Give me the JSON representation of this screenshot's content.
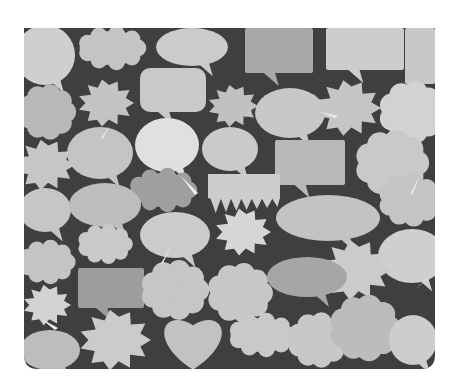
{
  "image": {
    "description": "Grayscale collage of assorted comic speech, thought and burst bubbles on a dark background",
    "width": 461,
    "height": 392,
    "frame": {
      "x": 24,
      "y": 28,
      "w": 411,
      "h": 341,
      "bottom_radius": 14
    },
    "colors": {
      "page_bg": "#ffffff",
      "dark_bg": "#3f3f3f",
      "bubble_light": "#d6d6d6",
      "bubble_mid": "#c2c2c2",
      "bubble_dark": "#a9a9a9",
      "bubble_darker": "#8f8f8f",
      "highlight": "#eeeeee"
    }
  },
  "bubbles": [
    {
      "type": "ellipse",
      "cx": 45,
      "cy": 55,
      "rx": 30,
      "ry": 30,
      "fill": "#cfcfcf"
    },
    {
      "type": "cloud",
      "cx": 112,
      "cy": 48,
      "rx": 36,
      "ry": 20,
      "fill": "#c4c4c4"
    },
    {
      "type": "ellipse",
      "cx": 192,
      "cy": 47,
      "rx": 36,
      "ry": 19,
      "fill": "#cbcbcb"
    },
    {
      "type": "rect",
      "x": 245,
      "y": 28,
      "w": 68,
      "h": 45,
      "fill": "#a9a9a9"
    },
    {
      "type": "rect",
      "x": 326,
      "y": 28,
      "w": 78,
      "h": 42,
      "fill": "#cdcdcd"
    },
    {
      "type": "rect",
      "x": 405,
      "y": 28,
      "w": 30,
      "h": 56,
      "fill": "#c8c8c8"
    },
    {
      "type": "cloud",
      "cx": 47,
      "cy": 112,
      "rx": 26,
      "ry": 25,
      "fill": "#b8b8b8"
    },
    {
      "type": "burst",
      "cx": 106,
      "cy": 103,
      "r": 28,
      "fill": "#c3c3c3"
    },
    {
      "type": "rect",
      "x": 140,
      "y": 68,
      "w": 66,
      "h": 44,
      "rx": 10,
      "fill": "#c9c9c9"
    },
    {
      "type": "burst",
      "cx": 233,
      "cy": 106,
      "r": 25,
      "fill": "#c1c1c1"
    },
    {
      "type": "ellipse",
      "cx": 290,
      "cy": 113,
      "rx": 35,
      "ry": 25,
      "fill": "#c8c8c8"
    },
    {
      "type": "burst",
      "cx": 348,
      "cy": 108,
      "r": 33,
      "fill": "#c5c5c5"
    },
    {
      "type": "cloud",
      "cx": 412,
      "cy": 112,
      "rx": 30,
      "ry": 28,
      "fill": "#d2d2d2"
    },
    {
      "type": "ellipse",
      "cx": 167,
      "cy": 145,
      "rx": 32,
      "ry": 27,
      "fill": "#e0e0e0"
    },
    {
      "type": "ellipse",
      "cx": 100,
      "cy": 153,
      "rx": 33,
      "ry": 26,
      "fill": "#c4c4c4"
    },
    {
      "type": "ellipse",
      "cx": 230,
      "cy": 149,
      "rx": 28,
      "ry": 22,
      "fill": "#cacaca"
    },
    {
      "type": "burst",
      "cx": 45,
      "cy": 165,
      "r": 30,
      "fill": "#c6c6c6"
    },
    {
      "type": "rect",
      "x": 275,
      "y": 140,
      "w": 70,
      "h": 45,
      "fill": "#b9b9b9"
    },
    {
      "type": "cloud",
      "cx": 392,
      "cy": 163,
      "rx": 34,
      "ry": 30,
      "fill": "#c9c9c9"
    },
    {
      "type": "cloud",
      "cx": 163,
      "cy": 190,
      "rx": 36,
      "ry": 20,
      "fill": "#9f9f9f"
    },
    {
      "type": "drip",
      "x": 208,
      "y": 174,
      "w": 72,
      "h": 40,
      "fill": "#cdcdcd"
    },
    {
      "type": "ellipse",
      "cx": 45,
      "cy": 210,
      "rx": 26,
      "ry": 22,
      "fill": "#c6c6c6"
    },
    {
      "type": "ellipse",
      "cx": 105,
      "cy": 205,
      "rx": 36,
      "ry": 22,
      "fill": "#bdbdbd"
    },
    {
      "type": "ellipse",
      "cx": 328,
      "cy": 218,
      "rx": 52,
      "ry": 23,
      "fill": "#c3c3c3"
    },
    {
      "type": "cloud",
      "cx": 410,
      "cy": 200,
      "rx": 30,
      "ry": 24,
      "fill": "#c4c4c4"
    },
    {
      "type": "burst",
      "cx": 243,
      "cy": 232,
      "r": 28,
      "fill": "#d6d6d6"
    },
    {
      "type": "ellipse",
      "cx": 175,
      "cy": 235,
      "rx": 35,
      "ry": 23,
      "fill": "#cbcbcb"
    },
    {
      "type": "cloud",
      "cx": 105,
      "cy": 244,
      "rx": 28,
      "ry": 18,
      "fill": "#c9c9c9"
    },
    {
      "type": "cloud",
      "cx": 47,
      "cy": 262,
      "rx": 28,
      "ry": 20,
      "fill": "#c4c4c4"
    },
    {
      "type": "ellipse",
      "cx": 412,
      "cy": 256,
      "rx": 34,
      "ry": 27,
      "fill": "#cfcfcf"
    },
    {
      "type": "burst",
      "cx": 355,
      "cy": 270,
      "r": 36,
      "fill": "#cbcbcb"
    },
    {
      "type": "ellipse",
      "cx": 307,
      "cy": 277,
      "rx": 40,
      "ry": 20,
      "fill": "#a6a6a6"
    },
    {
      "type": "rect",
      "x": 78,
      "y": 268,
      "w": 66,
      "h": 40,
      "fill": "#9d9d9d"
    },
    {
      "type": "cloud",
      "cx": 175,
      "cy": 290,
      "rx": 32,
      "ry": 27,
      "fill": "#c6c6c6"
    },
    {
      "type": "cloud",
      "cx": 240,
      "cy": 293,
      "rx": 30,
      "ry": 27,
      "fill": "#c7c7c7"
    },
    {
      "type": "burst",
      "cx": 47,
      "cy": 305,
      "r": 24,
      "fill": "#d2d2d2"
    },
    {
      "type": "burst",
      "cx": 115,
      "cy": 340,
      "r": 36,
      "fill": "#cbcbcb"
    },
    {
      "type": "heart",
      "cx": 193,
      "cy": 340,
      "s": 33,
      "fill": "#c2c2c2"
    },
    {
      "type": "cloud",
      "cx": 262,
      "cy": 335,
      "rx": 35,
      "ry": 20,
      "fill": "#c9c9c9"
    },
    {
      "type": "cloud",
      "cx": 318,
      "cy": 340,
      "rx": 28,
      "ry": 25,
      "fill": "#c8c8c8"
    },
    {
      "type": "cloud",
      "cx": 365,
      "cy": 328,
      "rx": 32,
      "ry": 30,
      "fill": "#bcbcbc"
    },
    {
      "type": "ellipse",
      "cx": 413,
      "cy": 340,
      "rx": 24,
      "ry": 25,
      "fill": "#cdcdcd"
    },
    {
      "type": "ellipse",
      "cx": 50,
      "cy": 350,
      "rx": 30,
      "ry": 20,
      "fill": "#bdbdbd"
    }
  ]
}
